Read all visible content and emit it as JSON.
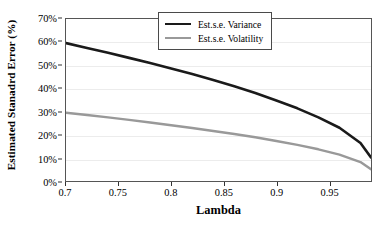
{
  "chart_data": {
    "type": "line",
    "title": "",
    "xlabel": "Lambda",
    "ylabel": "Estimated Stanadrd Error (%)",
    "xlim": [
      0.7,
      0.99
    ],
    "ylim": [
      0,
      70
    ],
    "xticks": [
      "0.7",
      "0.75",
      "0.8",
      "0.85",
      "0.9",
      "0.95"
    ],
    "xtick_values": [
      0.7,
      0.75,
      0.8,
      0.85,
      0.9,
      0.95
    ],
    "yticks": [
      "0%",
      "10%",
      "20%",
      "30%",
      "40%",
      "50%",
      "60%",
      "70%"
    ],
    "ytick_values": [
      0,
      10,
      20,
      30,
      40,
      50,
      60,
      70
    ],
    "grid": "horizontal",
    "legend_position": "upper-right-inside",
    "x": [
      0.7,
      0.72,
      0.74,
      0.76,
      0.78,
      0.8,
      0.82,
      0.84,
      0.86,
      0.88,
      0.9,
      0.92,
      0.94,
      0.96,
      0.98,
      0.99
    ],
    "series": [
      {
        "name": "Est.s.e. Variance",
        "color": "#1a1a1a",
        "width": 2.6,
        "values": [
          59.6,
          57.5,
          55.4,
          53.2,
          51.0,
          48.6,
          46.2,
          43.6,
          40.9,
          38.0,
          34.8,
          31.4,
          27.5,
          23.0,
          16.4,
          10.2
        ]
      },
      {
        "name": "Est.s.e. Volatility",
        "color": "#999999",
        "width": 2.4,
        "values": [
          29.5,
          28.5,
          27.5,
          26.4,
          25.3,
          24.1,
          22.9,
          21.6,
          20.3,
          18.9,
          17.3,
          15.6,
          13.7,
          11.4,
          8.2,
          5.1
        ]
      }
    ]
  },
  "axes": {
    "ylabel": "Estimated Stanadrd Error (%)",
    "xlabel": "Lambda"
  },
  "legend": {
    "items": [
      {
        "label": "Est.s.e. Variance"
      },
      {
        "label": "Est.s.e. Volatility"
      }
    ]
  }
}
